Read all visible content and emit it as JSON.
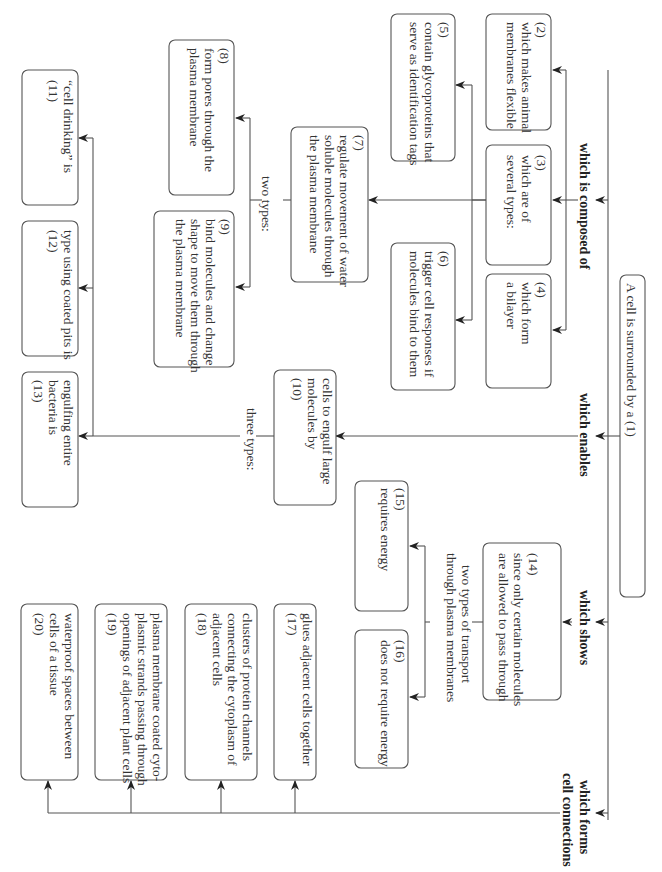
{
  "diagram": {
    "orientation": "rotated-90-clockwise",
    "root": "A cell is surrounded by a (1)",
    "links": {
      "composed": "which is composed of",
      "enables": "which enables",
      "shows": "which shows",
      "forms_1": "which forms",
      "forms_2": "cell connections"
    },
    "sublabels": {
      "protein_types": "two types:",
      "endo_types": "three types:",
      "transport_1": "two types of transport",
      "transport_2": "through plasma membranes"
    },
    "boxes": {
      "b2": [
        "(2)",
        "which makes animal",
        "membranes flexible"
      ],
      "b3": [
        "(3)",
        "which are of",
        "several types:"
      ],
      "b4": [
        "(4)",
        "which form",
        "a bilayer"
      ],
      "b5": [
        "(5)",
        "contain glycoproteins that",
        "serve as identification tags"
      ],
      "b6": [
        "(6)",
        "trigger cell responses if",
        "molecules bind to them"
      ],
      "b7": [
        "(7)",
        "regulate movement of water",
        "soluble molecules through",
        "the plasma membrane"
      ],
      "b8": [
        "(8)",
        "form pores through the",
        "plasma membrane"
      ],
      "b9": [
        "(9)",
        "bind molecules and change",
        "shape to move them through",
        "the plasma membrane"
      ],
      "b10": [
        "cells to engulf large",
        "molecules by",
        "(10)"
      ],
      "b11": [
        "“cell drinking” is",
        "(11)"
      ],
      "b12": [
        "type using coated pits is",
        "(12)"
      ],
      "b13": [
        "engulfing entire",
        "bacteria is",
        "(13)"
      ],
      "b14": [
        "(14)",
        "since only certain molecules",
        "are allowed to pass through"
      ],
      "b15": [
        "(15)",
        "requires energy"
      ],
      "b16": [
        "(16)",
        "does not require energy"
      ],
      "b17": [
        "glues adjacent cells together",
        "(17)"
      ],
      "b18": [
        "clusters of protein channels",
        "connecting the cytoplasm of",
        "adjacent cells",
        "(18)"
      ],
      "b19": [
        "plasma membrane coated cyto-",
        "plasmic strands passing through",
        "openings of adjacent plant cells",
        "(19)"
      ],
      "b20": [
        "waterproof spaces between",
        "cells of a tissue",
        "(20)"
      ]
    }
  }
}
